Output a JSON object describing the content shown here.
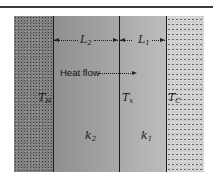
{
  "figure": {
    "type": "composite-wall-heat-conduction",
    "regions": [
      {
        "id": "hot-reservoir",
        "temperature_label": {
          "symbol": "T",
          "subscript": "H"
        }
      },
      {
        "id": "slab-2",
        "conductivity_label": {
          "symbol": "k",
          "subscript": "2"
        },
        "thickness_label": {
          "symbol": "L",
          "subscript": "2"
        }
      },
      {
        "id": "slab-1",
        "conductivity_label": {
          "symbol": "k",
          "subscript": "1"
        },
        "thickness_label": {
          "symbol": "L",
          "subscript": "1"
        }
      },
      {
        "id": "cold-reservoir",
        "temperature_label": {
          "symbol": "T",
          "subscript": "C"
        }
      }
    ],
    "interface_temperature": {
      "symbol": "T",
      "subscript": "x"
    },
    "heat_flow_label": "Heat flow",
    "heat_flow_direction": "right"
  },
  "labels": {
    "L2": {
      "symbol": "L",
      "sub": "2"
    },
    "L1": {
      "symbol": "L",
      "sub": "1"
    },
    "TH": {
      "symbol": "T",
      "sub": "H"
    },
    "Tx": {
      "symbol": "T",
      "sub": "x"
    },
    "TC": {
      "symbol": "T",
      "sub": "C"
    },
    "k2": {
      "symbol": "k",
      "sub": "2"
    },
    "k1": {
      "symbol": "k",
      "sub": "1"
    },
    "heat_flow": "Heat flow"
  },
  "colors": {
    "hot_region": "#7e7e7e",
    "slab2": "#9a9a9a",
    "slab1": "#b3b3b3",
    "cold_region": "#cfcfcf",
    "lines": "#1a1a1a"
  }
}
